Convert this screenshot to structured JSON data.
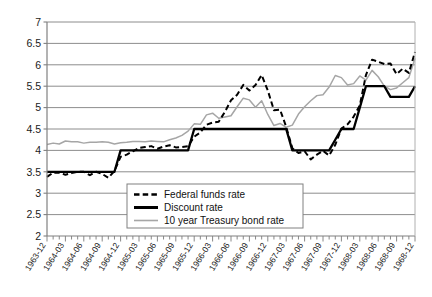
{
  "chart_data": {
    "type": "line",
    "title": "",
    "xlabel": "",
    "ylabel": "",
    "ylim": [
      2,
      7
    ],
    "ytick_values": [
      2,
      2.5,
      3,
      3.5,
      4,
      4.5,
      5,
      5.5,
      6,
      6.5,
      7
    ],
    "ytick_labels": [
      "2",
      "2.5",
      "3",
      "3.5",
      "4",
      "4.5",
      "5",
      "5.5",
      "6",
      "6.5",
      "7"
    ],
    "grid": true,
    "grid_axis": "y",
    "legend_position": "bottom-center",
    "x_tick_interval": "monthly",
    "x_label_interval": "quarterly",
    "categories": [
      "1963-12",
      "1964-01",
      "1964-02",
      "1964-03",
      "1964-04",
      "1964-05",
      "1964-06",
      "1964-07",
      "1964-08",
      "1964-09",
      "1964-10",
      "1964-11",
      "1964-12",
      "1965-01",
      "1965-02",
      "1965-03",
      "1965-04",
      "1965-05",
      "1965-06",
      "1965-07",
      "1965-08",
      "1965-09",
      "1965-10",
      "1965-11",
      "1965-12",
      "1966-01",
      "1966-02",
      "1966-03",
      "1966-04",
      "1966-05",
      "1966-06",
      "1966-07",
      "1966-08",
      "1966-09",
      "1966-10",
      "1966-11",
      "1966-12",
      "1967-01",
      "1967-02",
      "1967-03",
      "1967-04",
      "1967-05",
      "1967-06",
      "1967-07",
      "1967-08",
      "1967-09",
      "1967-10",
      "1967-11",
      "1967-12",
      "1968-01",
      "1968-02",
      "1968-03",
      "1968-04",
      "1968-05",
      "1968-06",
      "1968-07",
      "1968-08",
      "1968-09",
      "1968-10",
      "1968-11",
      "1968-12"
    ],
    "xtick_labels": [
      "1963-12",
      "1964-03",
      "1964-06",
      "1964-09",
      "1964-12",
      "1965-03",
      "1965-06",
      "1965-09",
      "1965-12",
      "1966-03",
      "1966-06",
      "1966-09",
      "1966-12",
      "1967-03",
      "1967-06",
      "1967-09",
      "1967-12",
      "1968-03",
      "1968-06",
      "1968-09",
      "1968-12"
    ],
    "series": [
      {
        "name": "Federal funds rate",
        "style": "dashed",
        "color": "#000000",
        "values": [
          3.38,
          3.48,
          3.48,
          3.43,
          3.47,
          3.5,
          3.5,
          3.42,
          3.5,
          3.45,
          3.36,
          3.52,
          3.85,
          3.9,
          3.98,
          4.06,
          4.08,
          4.1,
          4.04,
          4.09,
          4.12,
          4.07,
          4.08,
          4.1,
          4.32,
          4.42,
          4.6,
          4.65,
          4.67,
          4.9,
          5.17,
          5.3,
          5.53,
          5.4,
          5.53,
          5.76,
          5.4,
          4.94,
          4.95,
          4.55,
          4.05,
          3.94,
          3.98,
          3.79,
          3.9,
          3.99,
          3.88,
          4.13,
          4.51,
          4.61,
          4.79,
          5.05,
          5.76,
          6.12,
          6.07,
          6.02,
          6.03,
          5.78,
          5.91,
          5.81,
          6.3
        ]
      },
      {
        "name": "Discount rate",
        "style": "solid",
        "color": "#000000",
        "values": [
          3.5,
          3.5,
          3.5,
          3.5,
          3.5,
          3.5,
          3.5,
          3.5,
          3.5,
          3.5,
          3.5,
          3.5,
          4.0,
          4.0,
          4.0,
          4.0,
          4.0,
          4.0,
          4.0,
          4.0,
          4.0,
          4.0,
          4.0,
          4.0,
          4.5,
          4.5,
          4.5,
          4.5,
          4.5,
          4.5,
          4.5,
          4.5,
          4.5,
          4.5,
          4.5,
          4.5,
          4.5,
          4.5,
          4.5,
          4.5,
          4.0,
          4.0,
          4.0,
          4.0,
          4.0,
          4.0,
          4.0,
          4.25,
          4.5,
          4.5,
          4.5,
          5.0,
          5.5,
          5.5,
          5.5,
          5.5,
          5.25,
          5.25,
          5.25,
          5.25,
          5.5
        ]
      },
      {
        "name": "10 year Treasury bond rate",
        "style": "solid",
        "color": "#a6a6a6",
        "values": [
          4.14,
          4.17,
          4.15,
          4.22,
          4.2,
          4.2,
          4.17,
          4.19,
          4.19,
          4.2,
          4.19,
          4.15,
          4.18,
          4.19,
          4.21,
          4.21,
          4.2,
          4.22,
          4.21,
          4.2,
          4.25,
          4.29,
          4.35,
          4.45,
          4.62,
          4.61,
          4.83,
          4.87,
          4.75,
          4.78,
          4.81,
          5.02,
          5.22,
          5.18,
          5.01,
          5.16,
          4.84,
          4.58,
          4.63,
          4.54,
          4.59,
          4.85,
          5.02,
          5.16,
          5.28,
          5.3,
          5.48,
          5.75,
          5.7,
          5.53,
          5.56,
          5.74,
          5.64,
          5.87,
          5.72,
          5.5,
          5.42,
          5.46,
          5.58,
          5.7,
          6.15
        ]
      }
    ]
  },
  "legend": {
    "items": [
      {
        "label": "Federal funds rate"
      },
      {
        "label": "Discount rate"
      },
      {
        "label": "10 year Treasury bond rate"
      }
    ]
  }
}
